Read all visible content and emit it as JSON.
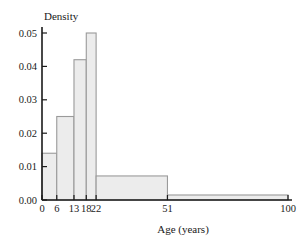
{
  "chart_data": {
    "type": "bar",
    "title": "",
    "subtitle": "",
    "xlabel": "Age (years)",
    "ylabel": "Density",
    "grid": false,
    "legend": null,
    "legend_position": "none",
    "xlim": [
      0,
      100
    ],
    "ylim": [
      0.0,
      0.05
    ],
    "bin_edges": [
      0,
      6,
      13,
      18,
      22,
      51,
      100
    ],
    "categories": [
      "0-6",
      "6-13",
      "13-18",
      "18-22",
      "22-51",
      "51-100"
    ],
    "values": [
      0.014,
      0.025,
      0.042,
      0.05,
      0.0072,
      0.0015
    ],
    "x_tick_labels": [
      "0",
      "6",
      "13",
      "18",
      "22",
      "51",
      "100"
    ],
    "x_tick_values": [
      0,
      6,
      13,
      18,
      22,
      51,
      100
    ],
    "y_tick_labels": [
      "0.00",
      "0.01",
      "0.02",
      "0.03",
      "0.04",
      "0.05"
    ],
    "y_tick_values": [
      0.0,
      0.01,
      0.02,
      0.03,
      0.04,
      0.05
    ],
    "bar_fill_color": "#ececec",
    "bar_stroke_color": "#9a9a9a",
    "axis_color": "#1a1a1a"
  }
}
